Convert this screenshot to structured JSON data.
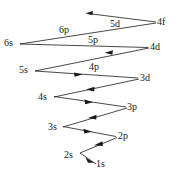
{
  "figure": {
    "type": "diagram",
    "background_color": "#ffffff",
    "line_color": "#1a1a1a",
    "text_color": "#171717",
    "width": 179,
    "height": 183
  },
  "orbitals": [
    {
      "id": "4f",
      "label": "4f",
      "x": 157,
      "y": 17
    },
    {
      "id": "5d",
      "label": "5d",
      "x": 110,
      "y": 19
    },
    {
      "id": "6p",
      "label": "6p",
      "x": 59,
      "y": 25
    },
    {
      "id": "6s",
      "label": "6s",
      "x": 4,
      "y": 38
    },
    {
      "id": "5p",
      "label": "5p",
      "x": 88,
      "y": 35
    },
    {
      "id": "4d",
      "label": "4d",
      "x": 150,
      "y": 42
    },
    {
      "id": "5s",
      "label": "5s",
      "x": 19,
      "y": 65
    },
    {
      "id": "4p",
      "label": "4p",
      "x": 89,
      "y": 62
    },
    {
      "id": "3d",
      "label": "3d",
      "x": 140,
      "y": 73
    },
    {
      "id": "4s",
      "label": "4s",
      "x": 38,
      "y": 92
    },
    {
      "id": "3p",
      "label": "3p",
      "x": 127,
      "y": 102
    },
    {
      "id": "3s",
      "label": "3s",
      "x": 48,
      "y": 122
    },
    {
      "id": "2p",
      "label": "2p",
      "x": 118,
      "y": 131
    },
    {
      "id": "2s",
      "label": "2s",
      "x": 64,
      "y": 150
    },
    {
      "id": "1s",
      "label": "1s",
      "x": 96,
      "y": 159
    }
  ],
  "arrows": [
    {
      "id": "arrow-2s-1s",
      "from": "2s",
      "to": "1s",
      "x1": 80,
      "y1": 153,
      "x2": 96,
      "y2": 164
    },
    {
      "id": "arrow-2p-2s",
      "from": "2p",
      "to": "2s",
      "x1": 117,
      "y1": 137,
      "x2": 80,
      "y2": 153
    },
    {
      "id": "arrow-3s-2p",
      "from": "3s",
      "to": "2p",
      "x1": 63,
      "y1": 126,
      "x2": 116,
      "y2": 136
    },
    {
      "id": "arrow-3p-3s",
      "from": "3p",
      "to": "3s",
      "x1": 127,
      "y1": 108,
      "x2": 63,
      "y2": 127
    },
    {
      "id": "arrow-4s-3p",
      "from": "4s",
      "to": "3p",
      "x1": 54,
      "y1": 96,
      "x2": 126,
      "y2": 107
    },
    {
      "id": "arrow-3d-4s",
      "from": "3d",
      "to": "4s",
      "x1": 139,
      "y1": 79,
      "x2": 54,
      "y2": 97
    },
    {
      "id": "arrow-5s-4p",
      "from": "5s",
      "to": "3d",
      "x1": 35,
      "y1": 70,
      "x2": 138,
      "y2": 78
    },
    {
      "id": "arrow-4d-4p",
      "from": "4d",
      "to": "5s",
      "x1": 149,
      "y1": 48,
      "x2": 35,
      "y2": 71
    },
    {
      "id": "arrow-6s-4d",
      "from": "6s",
      "to": "4d",
      "x1": 20,
      "y1": 44,
      "x2": 148,
      "y2": 47
    },
    {
      "id": "arrow-4f-6s",
      "from": "4f",
      "to": "6s",
      "x1": 156,
      "y1": 23,
      "x2": 20,
      "y2": 44
    },
    {
      "id": "arrow-4f-5d",
      "from": "4f",
      "to": "5d",
      "x1": 156,
      "y1": 22,
      "x2": 86,
      "y2": 13
    }
  ],
  "mid_arrowheads": [
    {
      "id": "head-4d-5s",
      "x": 108,
      "y": 52,
      "angle": 191
    },
    {
      "id": "head-5s-3d",
      "x": 82,
      "y": 74,
      "angle": 4
    },
    {
      "id": "head-3d-4s",
      "x": 90,
      "y": 89,
      "angle": 192
    },
    {
      "id": "head-4s-3p",
      "x": 92,
      "y": 102,
      "angle": 9
    },
    {
      "id": "head-3p-3s",
      "x": 92,
      "y": 118,
      "angle": 196
    },
    {
      "id": "head-3s-2p",
      "x": 92,
      "y": 131,
      "angle": 11
    },
    {
      "id": "head-2p-2s",
      "x": 96,
      "y": 144,
      "angle": 203
    },
    {
      "id": "head-2s-1s",
      "x": 92,
      "y": 159,
      "angle": 34
    },
    {
      "id": "head-4f-5d",
      "x": 87,
      "y": 13,
      "angle": 187
    },
    {
      "id": "head-6s-4d",
      "x": 146,
      "y": 47,
      "angle": 1
    },
    {
      "id": "head-5s-4p",
      "x": 79,
      "y": 72,
      "angle": 184
    }
  ]
}
